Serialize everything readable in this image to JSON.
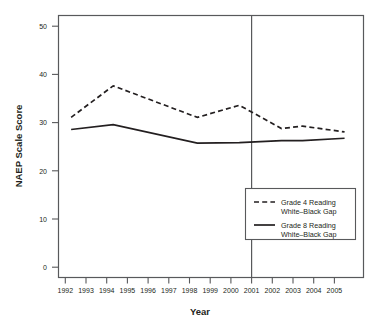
{
  "chart_data": {
    "type": "line",
    "title": "",
    "xlabel": "Year",
    "ylabel": "NAEP Scale Score",
    "xlim": [
      1991.4,
      2005.9
    ],
    "ylim": [
      -1.5,
      52.5
    ],
    "grid": false,
    "legend_position": "bottom-right",
    "x": [
      1992,
      1994,
      1998,
      2000,
      2002,
      2003,
      2005
    ],
    "xtick_labels": [
      "1992",
      "1993",
      "1994",
      "1995",
      "1996",
      "1997",
      "1998",
      "1999",
      "2000",
      "2001",
      "2002",
      "2003",
      "2004",
      "2005"
    ],
    "xticks": [
      1992,
      1993,
      1994,
      1995,
      1996,
      1997,
      1998,
      1999,
      2000,
      2001,
      2002,
      2003,
      2004,
      2005
    ],
    "ytick_labels": [
      "0",
      "10",
      "20",
      "30",
      "40",
      "50"
    ],
    "yticks": [
      0,
      10,
      20,
      30,
      40,
      50
    ],
    "series": [
      {
        "name": "Grade 4 Reading\nWhite–Black Gap",
        "style": "dashed",
        "color": "#231f20",
        "x": [
          1992,
          1994,
          1998,
          2000,
          2002,
          2003,
          2005
        ],
        "values": [
          31.5,
          38.0,
          31.5,
          34.0,
          29.2,
          29.7,
          28.5
        ]
      },
      {
        "name": "Grade 8 Reading\nWhite–Black Gap",
        "style": "solid",
        "color": "#231f20",
        "x": [
          1992,
          1994,
          1998,
          2000,
          2002,
          2003,
          2005
        ],
        "values": [
          29.0,
          30.0,
          26.2,
          26.3,
          26.7,
          26.7,
          27.2
        ]
      }
    ],
    "annotations": [
      {
        "type": "vertical-line",
        "x": 2001,
        "label": "",
        "color": "#58595b"
      }
    ]
  },
  "axes": {
    "y_title": "NAEP Scale Score",
    "x_title": "Year"
  },
  "legend": {
    "items": [
      {
        "line_style": "dashed",
        "label_line1": "Grade 4 Reading",
        "label_line2": "White–Black Gap"
      },
      {
        "line_style": "solid",
        "label_line1": "Grade 8 Reading",
        "label_line2": "White–Black Gap"
      }
    ]
  },
  "ticks": {
    "y": [
      "50",
      "40",
      "30",
      "20",
      "10",
      "0"
    ],
    "x": [
      "1992",
      "1993",
      "1994",
      "1995",
      "1996",
      "1997",
      "1998",
      "1999",
      "2000",
      "2001",
      "2002",
      "2003",
      "2004",
      "2005"
    ]
  }
}
